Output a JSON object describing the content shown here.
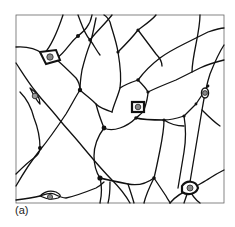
{
  "figure": {
    "panel_label": "(a)",
    "frame": {
      "x": 16,
      "y": 15,
      "width": 208,
      "height": 188
    },
    "colors": {
      "line": "#111111",
      "frame": "#555555",
      "background": "#ffffff"
    },
    "nuclei_count": 7
  }
}
